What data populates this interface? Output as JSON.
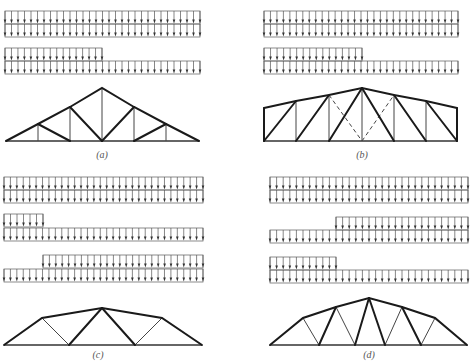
{
  "figure": {
    "colors": {
      "background": "#ffffff",
      "member": "#1a1a1a",
      "load_outline": "#6f6f6f",
      "arrow": "#333333"
    },
    "arrow_spacing": 6.5,
    "row_height": 13
  },
  "panels": [
    {
      "id": "a",
      "caption": "(a)",
      "caption_pos": [
        102,
        157
      ],
      "load_patterns": [
        {
          "rows": [
            {
              "x1": 5,
              "x2": 200,
              "y": 11
            },
            {
              "x1": 5,
              "x2": 200,
              "y": 24
            }
          ]
        },
        {
          "rows": [
            {
              "x1": 5,
              "x2": 102,
              "y": 48
            },
            {
              "x1": 5,
              "x2": 200,
              "y": 61
            }
          ]
        }
      ],
      "truss": {
        "top_chord": [
          [
            6,
            141
          ],
          [
            38,
            124
          ],
          [
            70,
            107
          ],
          [
            102,
            88
          ],
          [
            134,
            107
          ],
          [
            166,
            124
          ],
          [
            199,
            141
          ]
        ],
        "bottom_chord": [
          [
            6,
            141
          ],
          [
            199,
            141
          ]
        ],
        "webs_heavy": [
          [
            [
              38,
              124
            ],
            [
              70,
              141
            ]
          ],
          [
            [
              70,
              107
            ],
            [
              102,
              141
            ]
          ],
          [
            [
              102,
              141
            ],
            [
              134,
              107
            ]
          ],
          [
            [
              134,
              141
            ],
            [
              166,
              124
            ]
          ]
        ],
        "webs_light": [
          [
            [
              38,
              124
            ],
            [
              38,
              141
            ]
          ],
          [
            [
              70,
              107
            ],
            [
              70,
              141
            ]
          ],
          [
            [
              102,
              88
            ],
            [
              102,
              141
            ]
          ],
          [
            [
              134,
              107
            ],
            [
              134,
              141
            ]
          ],
          [
            [
              166,
              124
            ],
            [
              166,
              141
            ]
          ]
        ],
        "webs_dashed": []
      }
    },
    {
      "id": "b",
      "caption": "(b)",
      "caption_pos": [
        362,
        157
      ],
      "load_patterns": [
        {
          "rows": [
            {
              "x1": 264,
              "x2": 458,
              "y": 11
            },
            {
              "x1": 264,
              "x2": 458,
              "y": 24
            }
          ]
        },
        {
          "rows": [
            {
              "x1": 264,
              "x2": 362,
              "y": 48
            },
            {
              "x1": 264,
              "x2": 458,
              "y": 61
            }
          ]
        }
      ],
      "truss": {
        "top_chord": [
          [
            264,
            108
          ],
          [
            296,
            101
          ],
          [
            329,
            95
          ],
          [
            362,
            88
          ],
          [
            394,
            95
          ],
          [
            426,
            101
          ],
          [
            457,
            108
          ]
        ],
        "bottom_chord": [
          [
            264,
            141
          ],
          [
            457,
            141
          ]
        ],
        "webs_heavy": [
          [
            [
              264,
              108
            ],
            [
              264,
              141
            ]
          ],
          [
            [
              457,
              108
            ],
            [
              457,
              141
            ]
          ],
          [
            [
              264,
              141
            ],
            [
              296,
              101
            ]
          ],
          [
            [
              296,
              141
            ],
            [
              329,
              95
            ]
          ],
          [
            [
              329,
              141
            ],
            [
              362,
              88
            ]
          ],
          [
            [
              362,
              88
            ],
            [
              394,
              141
            ]
          ],
          [
            [
              394,
              95
            ],
            [
              426,
              141
            ]
          ],
          [
            [
              426,
              101
            ],
            [
              457,
              141
            ]
          ]
        ],
        "webs_light": [
          [
            [
              296,
              101
            ],
            [
              296,
              141
            ]
          ],
          [
            [
              329,
              95
            ],
            [
              329,
              141
            ]
          ],
          [
            [
              362,
              88
            ],
            [
              362,
              141
            ]
          ],
          [
            [
              394,
              95
            ],
            [
              394,
              141
            ]
          ],
          [
            [
              426,
              101
            ],
            [
              426,
              141
            ]
          ]
        ],
        "webs_dashed": [
          [
            [
              329,
              95
            ],
            [
              362,
              141
            ]
          ],
          [
            [
              362,
              141
            ],
            [
              394,
              95
            ]
          ]
        ]
      }
    },
    {
      "id": "c",
      "caption": "(c)",
      "caption_pos": [
        98,
        357
      ],
      "load_patterns": [
        {
          "rows": [
            {
              "x1": 4,
              "x2": 203,
              "y": 177
            },
            {
              "x1": 4,
              "x2": 203,
              "y": 190
            }
          ]
        },
        {
          "rows": [
            {
              "x1": 4,
              "x2": 43,
              "y": 214
            },
            {
              "x1": 4,
              "x2": 203,
              "y": 228
            }
          ]
        },
        {
          "rows": [
            {
              "x1": 43,
              "x2": 203,
              "y": 255
            },
            {
              "x1": 4,
              "x2": 203,
              "y": 269
            }
          ]
        }
      ],
      "truss": {
        "top_chord": [
          [
            4,
            345
          ],
          [
            42,
            318
          ],
          [
            102,
            308
          ],
          [
            162,
            318
          ],
          [
            202,
            345
          ]
        ],
        "bottom_chord": [
          [
            4,
            345
          ],
          [
            202,
            345
          ]
        ],
        "webs_heavy": [
          [
            [
              69,
              345
            ],
            [
              102,
              308
            ]
          ],
          [
            [
              102,
              308
            ],
            [
              135,
              345
            ]
          ]
        ],
        "webs_light": [
          [
            [
              42,
              318
            ],
            [
              69,
              345
            ]
          ],
          [
            [
              135,
              345
            ],
            [
              162,
              318
            ]
          ]
        ],
        "webs_dashed": []
      }
    },
    {
      "id": "d",
      "caption": "(d)",
      "caption_pos": [
        369,
        357
      ],
      "load_patterns": [
        {
          "rows": [
            {
              "x1": 270,
              "x2": 468,
              "y": 177
            },
            {
              "x1": 270,
              "x2": 468,
              "y": 190
            }
          ]
        },
        {
          "rows": [
            {
              "x1": 336,
              "x2": 468,
              "y": 217
            },
            {
              "x1": 270,
              "x2": 468,
              "y": 230
            }
          ]
        },
        {
          "rows": [
            {
              "x1": 270,
              "x2": 336,
              "y": 257
            },
            {
              "x1": 270,
              "x2": 468,
              "y": 270
            }
          ]
        }
      ],
      "truss": {
        "top_chord": [
          [
            270,
            345
          ],
          [
            303,
            318
          ],
          [
            336,
            307
          ],
          [
            369,
            298
          ],
          [
            402,
            307
          ],
          [
            435,
            318
          ],
          [
            467,
            345
          ]
        ],
        "bottom_chord": [
          [
            270,
            345
          ],
          [
            467,
            345
          ]
        ],
        "webs_heavy": [
          [
            [
              319,
              345
            ],
            [
              336,
              307
            ]
          ],
          [
            [
              355,
              345
            ],
            [
              369,
              298
            ]
          ],
          [
            [
              369,
              298
            ],
            [
              385,
              345
            ]
          ],
          [
            [
              402,
              307
            ],
            [
              421,
              345
            ]
          ]
        ],
        "webs_light": [
          [
            [
              303,
              318
            ],
            [
              319,
              345
            ]
          ],
          [
            [
              336,
              307
            ],
            [
              355,
              345
            ]
          ],
          [
            [
              385,
              345
            ],
            [
              402,
              307
            ]
          ],
          [
            [
              421,
              345
            ],
            [
              435,
              318
            ]
          ]
        ],
        "webs_dashed": []
      }
    }
  ]
}
